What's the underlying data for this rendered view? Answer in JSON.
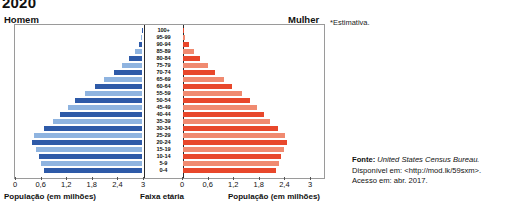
{
  "title": "2020",
  "left_header": "Homem",
  "right_header": "Mulher",
  "note": "*Estimativa.",
  "axis_caption_left": "População (em milhões)",
  "axis_caption_center": "Faixa etária",
  "axis_caption_right": "População (em milhões)",
  "source": {
    "label": "Fonte:",
    "publisher": "United States Census Bureau.",
    "available": "Disponível em: <http://mod.lk/59sxm>.",
    "accessed": "Acesso em: abr. 2017."
  },
  "colors": {
    "male_dark": "#2E5AA8",
    "male_light": "#8FB4E0",
    "female_dark": "#E8472B",
    "female_light": "#F08A70",
    "axis": "#2b2b2b",
    "frame": "#9a9a9a"
  },
  "chart_data": {
    "type": "bar",
    "subtype": "population-pyramid",
    "title": "2020",
    "xlabel": "População (em milhões)",
    "ylabel": "Faixa etária",
    "xlim": [
      0,
      3
    ],
    "xticks": [
      0,
      0.6,
      1.2,
      1.8,
      2.4,
      3
    ],
    "xticklabels_left": [
      "3",
      "2,4",
      "1,8",
      "1,2",
      "0,6",
      "0"
    ],
    "xticklabels_right": [
      "0",
      "0,6",
      "1,2",
      "1,8",
      "2,4",
      "3"
    ],
    "grid": false,
    "legend": [
      "Homem",
      "Mulher"
    ],
    "categories": [
      "100+",
      "95-99",
      "90-94",
      "85-89",
      "80-84",
      "75-79",
      "70-74",
      "65-69",
      "60-64",
      "55-59",
      "50-54",
      "45-49",
      "40-44",
      "35-39",
      "30-34",
      "25-29",
      "20-24",
      "15-19",
      "10-14",
      "5-9",
      "0-4"
    ],
    "series": [
      {
        "name": "Homem",
        "side": "left",
        "values": [
          0.01,
          0.03,
          0.08,
          0.17,
          0.3,
          0.46,
          0.66,
          0.88,
          1.1,
          1.33,
          1.56,
          1.74,
          1.92,
          2.08,
          2.3,
          2.52,
          2.58,
          2.48,
          2.42,
          2.36,
          2.3
        ]
      },
      {
        "name": "Mulher",
        "side": "right",
        "values": [
          0.02,
          0.05,
          0.13,
          0.25,
          0.41,
          0.58,
          0.76,
          0.96,
          1.16,
          1.38,
          1.58,
          1.74,
          1.9,
          2.04,
          2.22,
          2.4,
          2.44,
          2.36,
          2.3,
          2.24,
          2.18
        ]
      }
    ]
  }
}
